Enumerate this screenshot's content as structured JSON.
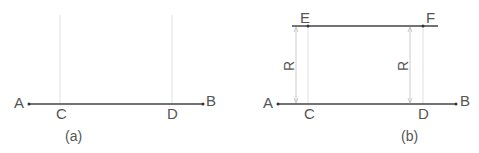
{
  "figure_a": {
    "caption": "(a)",
    "points": {
      "A": "A",
      "B": "B",
      "C": "C",
      "D": "D"
    }
  },
  "figure_b": {
    "caption": "(b)",
    "points": {
      "A": "A",
      "B": "B",
      "C": "C",
      "D": "D",
      "E": "E",
      "F": "F"
    },
    "dimension_left": "R",
    "dimension_right": "R"
  },
  "colors": {
    "main_line": "#444444",
    "construction_line": "#dddddd",
    "dimension_line": "#cccccc",
    "label": "#555555"
  }
}
